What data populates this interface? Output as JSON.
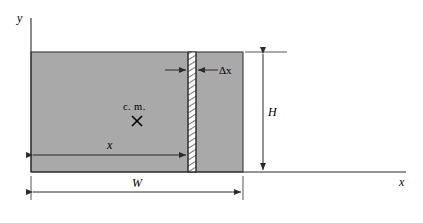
{
  "figure": {
    "background_color": "#ffffff",
    "slab_fill_color": "#a9a9a9",
    "line_color": "#2b2b2b"
  },
  "axes": {
    "y_axis_label": "y",
    "x_axis_label": "x",
    "origin_note": ""
  },
  "labels": {
    "center_of_mass": "c. m.",
    "center_of_mass_marker": "×",
    "strip_thickness": "Δx",
    "distance_to_strip": "x",
    "height": "H",
    "width": "W"
  },
  "geometry": {
    "slab_left_px": 31,
    "slab_top_px": 52,
    "slab_right_px": 243,
    "slab_bottom_px": 172,
    "strip_left_px": 188,
    "strip_right_px": 196,
    "cm_x_px": 137,
    "cm_y_px": 121,
    "height_dim_x_px": 263,
    "width_dim_y_px": 192,
    "x_dim_y_px": 155,
    "x_axis_end_px": 406,
    "y_axis_top_px": 18
  },
  "icons": {
    "cm_cross": "cross-mark-icon",
    "arrow": "arrowhead-icon"
  }
}
